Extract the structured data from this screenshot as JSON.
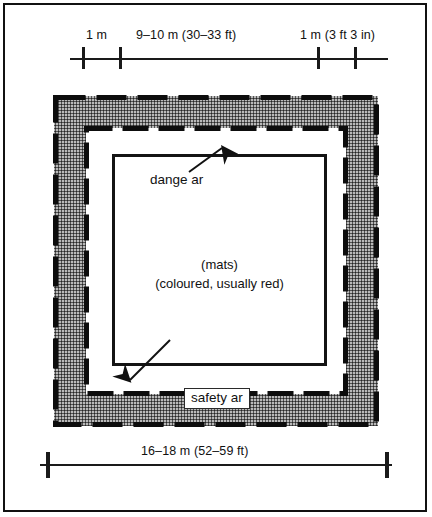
{
  "figure": {
    "colors": {
      "ink": "#111111",
      "safety_area_fill": "#b9b9b9",
      "mat_fill": "#ffffff",
      "danger_area_fill": "#ffffff"
    }
  },
  "top_dimension": {
    "labels": {
      "left_margin": "1 m",
      "middle_span": "9–10 m (30–33 ft)",
      "right_margin": "1 m (3 ft 3 in)"
    },
    "tick_count": 4
  },
  "bottom_dimension": {
    "label": "16–18 m (52–59 ft)",
    "tick_count": 2
  },
  "annotations": {
    "danger_area": "dange ar",
    "safety_area": "safety ar",
    "mats_line1": "(mats)",
    "mats_line2": "(coloured, usually red)"
  }
}
